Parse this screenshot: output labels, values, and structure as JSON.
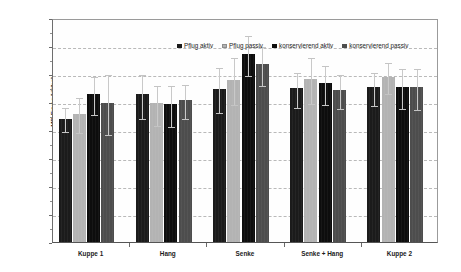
{
  "chart_data": {
    "type": "bar",
    "title": "",
    "subtitle": "",
    "xlabel": "",
    "ylabel": "MD-Ertrag [dt/ha]",
    "ylim": [
      0,
      160
    ],
    "ytick_step": 20,
    "yticks": [
      0,
      20,
      40,
      60,
      80,
      100,
      120,
      140,
      160
    ],
    "ytick_labels": [
      "0",
      "20",
      "40",
      "60",
      "80",
      "100",
      "120",
      "140",
      "160"
    ],
    "grid": "horizontal-dashed",
    "legend_position": "top-center-inside",
    "categories": [
      "Kuppe 1",
      "Hang",
      "Senke",
      "Senke + Hang",
      "Kuppe 2"
    ],
    "series": [
      {
        "name": "Pflug aktiv",
        "color": "#1b1b1b",
        "values": [
          88,
          106,
          109.5,
          110,
          110.5
        ],
        "err_low": [
          80,
          89,
          93.5,
          97.5,
          98.5
        ],
        "err_high": [
          97,
          121,
          125.5,
          122.5,
          122.5
        ]
      },
      {
        "name": "Pflug passiv",
        "color": "#b3b3b3",
        "values": [
          91.5,
          99.5,
          116,
          116.5,
          118
        ],
        "err_low": [
          79,
          84,
          99,
          100,
          107
        ],
        "err_high": [
          104,
          113,
          133,
          133,
          129.5
        ]
      },
      {
        "name": "konservierend aktiv",
        "color": "#0d0d0d",
        "values": [
          105.5,
          98.5,
          134.5,
          113.5,
          111
        ],
        "err_low": [
          92,
          83.5,
          120,
          99.5,
          96.5
        ],
        "err_high": [
          119,
          113,
          148.5,
          127,
          125
        ]
      },
      {
        "name": "konservierend passiv",
        "color": "#4d4d4d",
        "values": [
          99.5,
          101.5,
          127,
          108.5,
          110.5
        ],
        "err_low": [
          78,
          89.5,
          113,
          96.5,
          95.5
        ],
        "err_high": [
          120.5,
          113.5,
          141,
          120.5,
          125
        ]
      }
    ]
  },
  "legend": {
    "items": [
      {
        "label": "Pflug aktiv"
      },
      {
        "label": "Pflug passiv"
      },
      {
        "label": "konservierend aktiv"
      },
      {
        "label": "konservierend passiv"
      }
    ]
  },
  "axes": {
    "y_title": "MD-Ertrag [dt/ha]"
  }
}
